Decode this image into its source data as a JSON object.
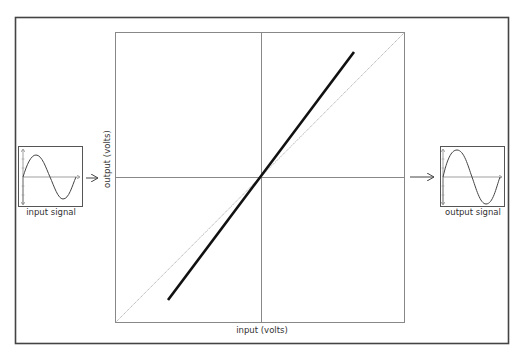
{
  "diagram": {
    "title": "",
    "plot": {
      "xlabel": "input (volts)",
      "ylabel": "output (volts)",
      "transfer_line": {
        "x1": 168,
        "y1": 300,
        "x2": 354,
        "y2": 52
      },
      "reference_diagonal": {
        "x1": 115,
        "y1": 322,
        "x2": 404,
        "y2": 32
      }
    },
    "input_panel": {
      "label": "input signal"
    },
    "output_panel": {
      "label": "output signal"
    },
    "colors": {
      "frame": "#444444",
      "axis": "#777777",
      "line": "#111111",
      "diagonal": "#888888"
    }
  }
}
